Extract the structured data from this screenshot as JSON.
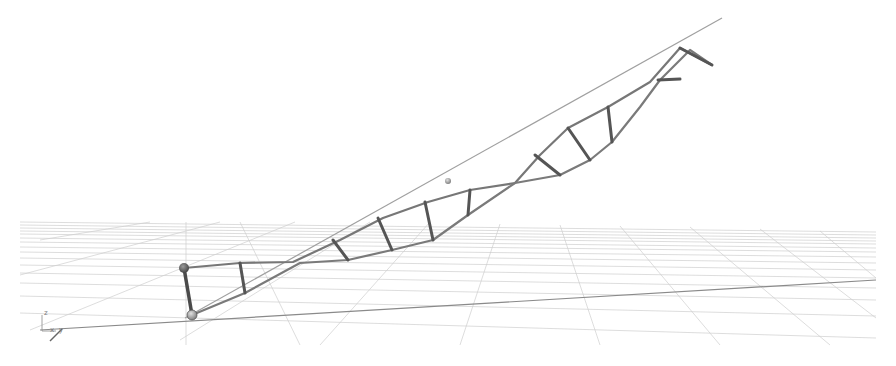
{
  "viewport": {
    "type": "3d-scene",
    "background": "#ffffff",
    "grid_color": "#c8c8c8",
    "grid_horizon_y": 222,
    "ground_line_color": "#8a8a8a",
    "structure_color": "#6e6e6e",
    "rung_color": "#555555",
    "axis_line_color": "#9a9a9a"
  },
  "gizmo": {
    "labels": {
      "z": "z",
      "x": "x",
      "y": "y"
    }
  },
  "scene_objects": {
    "joints": [
      {
        "name": "joint-top",
        "x": 184,
        "y": 268,
        "r": 5
      },
      {
        "name": "joint-bottom",
        "x": 192,
        "y": 315,
        "r": 5
      }
    ],
    "floating_sphere": {
      "x": 448,
      "y": 181,
      "r": 3
    }
  }
}
